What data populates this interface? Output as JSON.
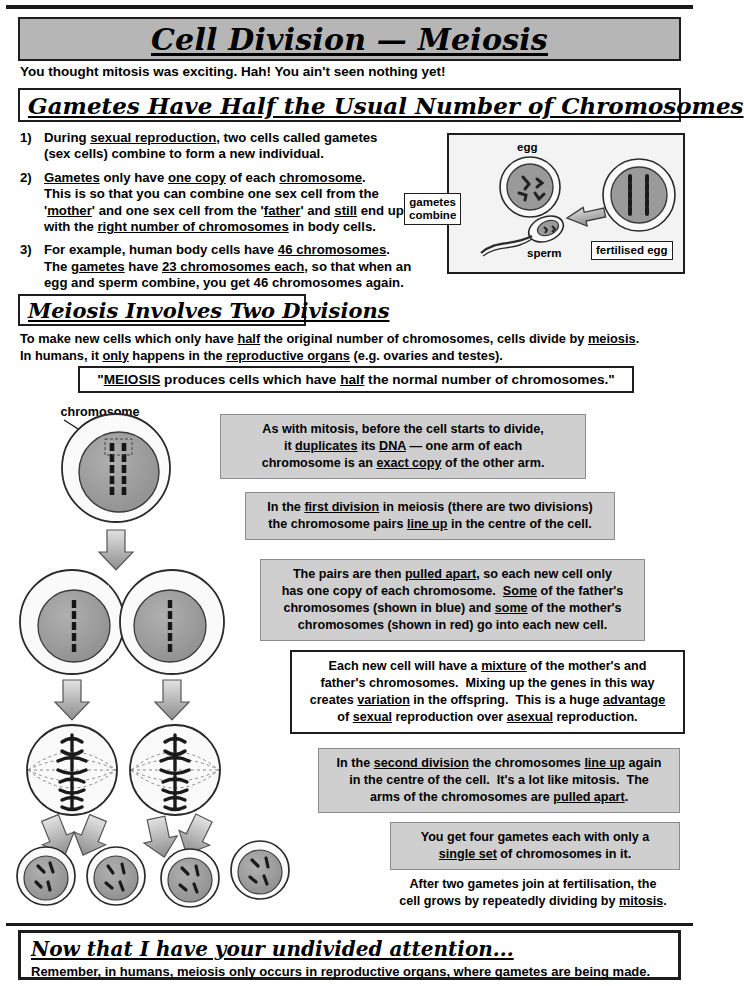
{
  "title": "Cell Division — Meiosis",
  "intro_line": "You thought mitosis was exciting.  Hah!  You ain't seen nothing yet!",
  "sections": {
    "gametes_heading": "Gametes Have Half the Usual Number of Chromosomes",
    "divisions_heading": "Meiosis Involves Two Divisions"
  },
  "numbered_list": [
    {
      "num": "1)",
      "text": "During sexual reproduction, two cells called gametes (sex cells) combine to form a new individual.",
      "underlined": [
        "sexual reproduction"
      ]
    },
    {
      "num": "2)",
      "text": "Gametes only have one copy of each chromosome. This is so that you can combine one sex cell from the 'mother' and one sex cell from the 'father' and still end up with the right number of chromosomes in body cells.",
      "underlined": [
        "Gametes",
        "one copy",
        "chromosome",
        "mother",
        "father",
        "still",
        "right number of chromosomes"
      ]
    },
    {
      "num": "3)",
      "text": "For example, human body cells have 46 chromosomes. The gametes have 23 chromosomes each, so that when an egg and sperm combine, you get 46 chromosomes again.",
      "underlined": [
        "46 chromosomes",
        "gametes",
        "23 chromosomes each"
      ]
    }
  ],
  "fertilisation_figure": {
    "egg_label": "egg",
    "sperm_label": "sperm",
    "combine_label_line1": "gametes",
    "combine_label_line2": "combine",
    "result_label": "fertilised egg"
  },
  "intro_paragraph": {
    "line1": "To make new cells which only have half the original number of chromosomes, cells divide by meiosis.",
    "line2": "In humans, it only happens in the reproductive organs (e.g. ovaries and testes).",
    "underlined": [
      "half",
      "meiosis",
      "only",
      "reproductive organs"
    ]
  },
  "quote": "\"MEIOSIS produces cells which have half the normal number of chromosomes.\"",
  "diagram": {
    "chromosome_pair_label_line1": "chromosome",
    "chromosome_pair_label_line2": "pair",
    "stage_count_parent": 1,
    "stage_count_after_first_division": 2,
    "stage_count_second_division": 2,
    "stage_count_gametes": 4
  },
  "callouts": [
    {
      "id": "duplication",
      "style": "grey",
      "lines": [
        "As with mitosis, before the cell starts to divide,",
        "it duplicates its DNA — one arm of each",
        "chromosome is an exact copy of the other arm."
      ],
      "underlined": [
        "duplicates",
        "DNA",
        "exact copy"
      ]
    },
    {
      "id": "first-division",
      "style": "grey",
      "lines": [
        "In the first division in meiosis (there are two divisions)",
        "the chromosome pairs line up in the centre of the cell."
      ],
      "underlined": [
        "first division",
        "line up"
      ]
    },
    {
      "id": "pulled-apart",
      "style": "grey",
      "lines": [
        "The pairs are then pulled apart, so each new cell only",
        "has one copy of each chromosome.  Some of the father's",
        "chromosomes (shown in blue) and some of the mother's",
        "chromosomes (shown in red) go into each new cell."
      ],
      "underlined": [
        "pulled apart",
        "Some",
        "some"
      ]
    },
    {
      "id": "mixture",
      "style": "white",
      "lines": [
        "Each new cell will have a mixture of the mother's and",
        "father's chromosomes.  Mixing up the genes in this way",
        "creates variation in the offspring.  This is a huge advantage",
        "of sexual reproduction over asexual reproduction."
      ],
      "underlined": [
        "mixture",
        "variation",
        "advantage",
        "sexual",
        "asexual"
      ]
    },
    {
      "id": "second-division",
      "style": "grey",
      "lines": [
        "In the second division the chromosomes line up again",
        "in the centre of the cell.  It's a lot like mitosis.  The",
        "arms of the chromosomes are pulled apart."
      ],
      "underlined": [
        "second division",
        "line up",
        "pulled apart"
      ]
    },
    {
      "id": "four-gametes",
      "style": "grey",
      "lines": [
        "You get four gametes each with only a",
        "single set of chromosomes in it."
      ],
      "underlined": [
        "single set"
      ]
    },
    {
      "id": "after-fertilisation",
      "style": "plain",
      "lines": [
        "After two gametes join at fertilisation, the",
        "cell grows by repeatedly dividing by mitosis."
      ],
      "underlined": [
        "mitosis"
      ]
    }
  ],
  "footer": {
    "heading": "Now that I have your undivided attention...",
    "text": "Remember, in humans, meiosis only occurs in reproductive organs, where gametes are being made."
  },
  "colors": {
    "title_box_fill": "#b6b6b6",
    "callout_fill": "#cfcfcf",
    "ink": "#1d1d1d",
    "cell_nucleus": "#9a9a9a",
    "cell_cytoplasm": "#f0f0f0",
    "arrow_fill": "#a8a8a8"
  }
}
